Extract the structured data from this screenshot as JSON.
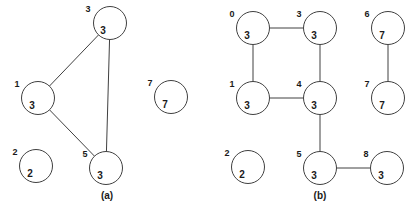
{
  "figure": {
    "title": "",
    "background_color": "#ffffff",
    "stroke_color": "#404040",
    "text_color": "#1a1a1a",
    "node_radius": 16.5
  },
  "panels": [
    {
      "id": "panel-a",
      "caption": "(a)",
      "caption_x": 107,
      "caption_y": 196,
      "nodes": [
        {
          "id": "a-n3",
          "index_label": "3",
          "value_label": "3",
          "cx": 110,
          "cy": 23,
          "index_x": 88,
          "index_y": 10,
          "value_x": 103,
          "value_y": 31
        },
        {
          "id": "a-n1",
          "index_label": "1",
          "value_label": "3",
          "cx": 38,
          "cy": 98,
          "index_x": 17,
          "index_y": 85,
          "value_x": 32,
          "value_y": 106
        },
        {
          "id": "a-n2",
          "index_label": "2",
          "value_label": "2",
          "cx": 36,
          "cy": 166,
          "index_x": 15,
          "index_y": 153,
          "value_x": 30,
          "value_y": 174
        },
        {
          "id": "a-n5",
          "index_label": "5",
          "value_label": "3",
          "cx": 106,
          "cy": 168,
          "index_x": 85,
          "index_y": 155,
          "value_x": 100,
          "value_y": 176
        },
        {
          "id": "a-n7",
          "index_label": "7",
          "value_label": "7",
          "cx": 171,
          "cy": 97,
          "index_x": 150,
          "index_y": 84,
          "value_x": 165,
          "value_y": 105
        }
      ],
      "edges": [
        {
          "id": "a-e-1-3",
          "from": "a-n1",
          "to": "a-n3"
        },
        {
          "id": "a-e-1-5",
          "from": "a-n1",
          "to": "a-n5"
        },
        {
          "id": "a-e-3-5",
          "from": "a-n3",
          "to": "a-n5"
        }
      ]
    },
    {
      "id": "panel-b",
      "caption": "(b)",
      "caption_x": 320,
      "caption_y": 196,
      "nodes": [
        {
          "id": "b-n0",
          "index_label": "0",
          "value_label": "3",
          "cx": 253,
          "cy": 28,
          "index_x": 232,
          "index_y": 15,
          "value_x": 247,
          "value_y": 36
        },
        {
          "id": "b-n3",
          "index_label": "3",
          "value_label": "3",
          "cx": 320,
          "cy": 28,
          "index_x": 299,
          "index_y": 15,
          "value_x": 314,
          "value_y": 36
        },
        {
          "id": "b-n6",
          "index_label": "6",
          "value_label": "7",
          "cx": 388,
          "cy": 28,
          "index_x": 367,
          "index_y": 15,
          "value_x": 382,
          "value_y": 36
        },
        {
          "id": "b-n1",
          "index_label": "1",
          "value_label": "3",
          "cx": 253,
          "cy": 98,
          "index_x": 232,
          "index_y": 85,
          "value_x": 247,
          "value_y": 106
        },
        {
          "id": "b-n4",
          "index_label": "4",
          "value_label": "3",
          "cx": 320,
          "cy": 98,
          "index_x": 299,
          "index_y": 85,
          "value_x": 314,
          "value_y": 106
        },
        {
          "id": "b-n7",
          "index_label": "7",
          "value_label": "7",
          "cx": 388,
          "cy": 98,
          "index_x": 367,
          "index_y": 85,
          "value_x": 382,
          "value_y": 106
        },
        {
          "id": "b-n2",
          "index_label": "2",
          "value_label": "2",
          "cx": 248,
          "cy": 167,
          "index_x": 227,
          "index_y": 154,
          "value_x": 242,
          "value_y": 175
        },
        {
          "id": "b-n5",
          "index_label": "5",
          "value_label": "3",
          "cx": 320,
          "cy": 168,
          "index_x": 299,
          "index_y": 155,
          "value_x": 314,
          "value_y": 176
        },
        {
          "id": "b-n8",
          "index_label": "8",
          "value_label": "3",
          "cx": 387,
          "cy": 168,
          "index_x": 366,
          "index_y": 155,
          "value_x": 381,
          "value_y": 176
        }
      ],
      "edges": [
        {
          "id": "b-e-0-3",
          "from": "b-n0",
          "to": "b-n3"
        },
        {
          "id": "b-e-0-1",
          "from": "b-n0",
          "to": "b-n1"
        },
        {
          "id": "b-e-3-4",
          "from": "b-n3",
          "to": "b-n4"
        },
        {
          "id": "b-e-1-4",
          "from": "b-n1",
          "to": "b-n4"
        },
        {
          "id": "b-e-4-5",
          "from": "b-n4",
          "to": "b-n5"
        },
        {
          "id": "b-e-5-8",
          "from": "b-n5",
          "to": "b-n8"
        },
        {
          "id": "b-e-6-7",
          "from": "b-n6",
          "to": "b-n7"
        }
      ]
    }
  ]
}
